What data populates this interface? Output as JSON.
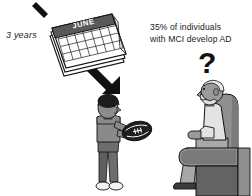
{
  "figure": {
    "type": "illustration",
    "domain": "medical-education",
    "background_color": "#ffffff",
    "palette": {
      "ink": "#111111",
      "calendar_banner": "#595959",
      "calendar_page": "#ffffff",
      "skin_young": "#8c8c8c",
      "hair_young": "#1c1c1c",
      "shirt_young": "#8a8a8a",
      "pants_young": "#6d6d6d",
      "shoes_young": "#f2f2f2",
      "football": "#1e1e1e",
      "football_laces": "#ffffff",
      "skin_old": "#9a9a9a",
      "hair_old": "#e8e8e8",
      "shirt_old": "#e3e3e3",
      "pants_old": "#a8a8a8",
      "shoe_old": "#3a3a3a",
      "chair_light": "#8f8f8f",
      "chair_mid": "#7a7a7a",
      "chair_dark": "#636363"
    }
  },
  "annotations": {
    "timespan_label": "3 years",
    "statistic_text": "35% of individuals\nwith MCI develop AD",
    "uncertainty_mark": "?"
  },
  "calendar": {
    "month_label": "JUNE",
    "grid_columns": 7,
    "grid_rows": 5
  },
  "elements": {
    "arrow_label": "progression-arrow",
    "young_person_label": "young-man-with-football",
    "old_person_label": "elderly-man-in-armchair",
    "football_label": "american-football",
    "armchair_label": "armchair"
  }
}
